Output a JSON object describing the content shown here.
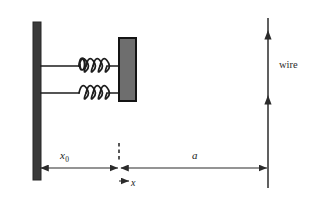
{
  "figure": {
    "labels": {
      "displacement_origin": "x",
      "displacement_subscript": "0",
      "distance_to_wire": "a",
      "coordinate_axis": "x",
      "wire": "wire"
    },
    "elements": {
      "wall": "wall",
      "block": "mass-block",
      "spring_top": "spring",
      "spring_bottom": "spring",
      "wire": "wire",
      "dashed_reference_line": "equilibrium-reference-line"
    },
    "colors": {
      "wall_fill": "#3a3a3a",
      "block_fill": "#6e6e6e",
      "block_border": "#1a1a1a",
      "line": "#2b2b2b",
      "background": "#ffffff"
    },
    "geometry": {
      "wall_x": 33,
      "wall_width": 8,
      "wall_top": 22,
      "wall_bottom": 180,
      "block_x": 119,
      "block_width": 17,
      "block_top": 38,
      "block_bottom": 101,
      "wire_x": 268,
      "wire_top": 18,
      "wire_bottom": 188,
      "dimension_line_y": 168,
      "spring_top_y": 66,
      "spring_bottom_y": 93,
      "spring_coils": 4,
      "wire_arrow_y": [
        38,
        103
      ]
    }
  }
}
